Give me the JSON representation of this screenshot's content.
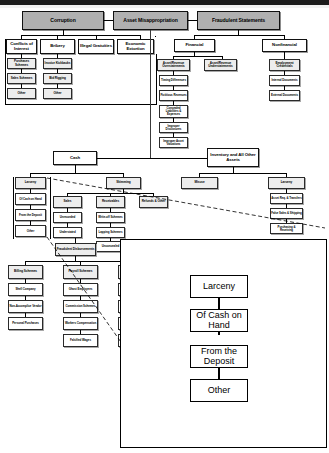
{
  "diagram": {
    "type": "hierarchy-tree-with-magnified-callout",
    "colors": {
      "level1_fill": "#b0b0b0",
      "level2_fill": "#ffffff",
      "level3_fill": "#ededed",
      "node_border": "#000000",
      "top_band": "#1c1c1c",
      "callout_border": "#000000",
      "leader_line": "#000000"
    }
  },
  "branches": {
    "corruption": {
      "label": "Corruption",
      "children": [
        {
          "label": "Conflicts of Interest",
          "children": [
            "Purchases Schemes",
            "Sales Schemes",
            "Other"
          ]
        },
        {
          "label": "Bribery",
          "children": [
            "Invoice Kickbacks",
            "Bid Rigging",
            "Other"
          ]
        },
        {
          "label": "Illegal Gratuities",
          "children": []
        },
        {
          "label": "Economic Extortion",
          "children": []
        }
      ]
    },
    "asset_misappropriation": {
      "label": "Asset Misappropriation",
      "children": [
        {
          "label": "Cash",
          "children": [
            {
              "label": "Larceny",
              "children": [
                "Of Cash on Hand",
                "From the Deposit",
                "Other"
              ]
            },
            {
              "label": "Skimming",
              "children": [
                {
                  "label": "Sales",
                  "children": [
                    "Unrecorded",
                    "Understated"
                  ]
                },
                {
                  "label": "Receivables",
                  "children": [
                    "Write-off Schemes",
                    "Lapping Schemes",
                    "Unconcealed"
                  ]
                },
                {
                  "label": "Refunds & Other",
                  "children": []
                }
              ]
            },
            {
              "label": "Fraudulent Disbursements",
              "children": [
                {
                  "label": "Billing Schemes",
                  "children": [
                    "Shell Company",
                    "Non-Accomplice Vendor",
                    "Personal Purchases"
                  ]
                },
                {
                  "label": "Payroll Schemes",
                  "children": [
                    "Ghost Employees",
                    "Commission Schemes",
                    "Workers Compensation",
                    "Falsified Wages"
                  ]
                },
                {
                  "label": "Expense Reimbursement Schemes",
                  "children": [
                    "Mischaracterized Expenses",
                    "Overstated Expenses",
                    "Fictitious Expenses",
                    "Multiple Reimbursements"
                  ]
                }
              ]
            }
          ]
        },
        {
          "label": "Inventory and All Other Assets",
          "children": [
            {
              "label": "Misuse",
              "children": []
            },
            {
              "label": "Larceny",
              "children": [
                "Asset Req. & Transfers",
                "False Sales & Shipping",
                "Purchasing & Receiving"
              ]
            }
          ]
        }
      ]
    },
    "fraudulent_statements": {
      "label": "Fraudulent Statements",
      "children": [
        {
          "label": "Financial",
          "children": [
            {
              "label": "Asset/Revenue Overstatements",
              "children": [
                "Timing Differences",
                "Fictitious Revenues",
                "Concealed Liabilities & Expenses",
                "Improper Disclosures",
                "Improper Asset Valuations"
              ]
            },
            {
              "label": "Asset/Revenue Understatements",
              "children": []
            }
          ]
        },
        {
          "label": "Nonfinancial",
          "children": [
            "Employment Credentials",
            "Internal Documents",
            "External Documents"
          ]
        }
      ]
    }
  },
  "callout": {
    "source_node": "Larceny",
    "nodes": [
      "Larceny",
      "Of Cash on Hand",
      "From the Deposit",
      "Other"
    ]
  },
  "nodes_flat": {
    "corruption": "Corruption",
    "asset_misappropriation": "Asset Misappropriation",
    "fraudulent_statements": "Fraudulent Statements",
    "conflicts_of_interest": "Conflicts of Interest",
    "bribery": "Bribery",
    "illegal_gratuities": "Illegal Gratuities",
    "economic_extortion": "Economic Extortion",
    "purchases_schemes": "Purchases Schemes",
    "sales_schemes": "Sales Schemes",
    "corruption_coi_other": "Other",
    "invoice_kickbacks": "Invoice Kickbacks",
    "bid_rigging": "Bid Rigging",
    "bribery_other": "Other",
    "financial": "Financial",
    "nonfinancial": "Nonfinancial",
    "asset_revenue_overstatements": "Asset/Revenue Overstatements",
    "asset_revenue_understatements": "Asset/Revenue Understatements",
    "timing_differences": "Timing Differences",
    "fictitious_revenues": "Fictitious Revenues",
    "concealed_liabilities": "Concealed Liabilities & Expenses",
    "improper_disclosures": "Improper Disclosures",
    "improper_asset_valuations": "Improper Asset Valuations",
    "employment_credentials": "Employment Credentials",
    "internal_documents": "Internal Documents",
    "external_documents": "External Documents",
    "cash": "Cash",
    "inventory_all_other": "Inventory and All Other Assets",
    "cash_larceny": "Larceny",
    "of_cash_on_hand": "Of Cash on Hand",
    "from_the_deposit": "From the Deposit",
    "larceny_other": "Other",
    "skimming": "Skimming",
    "sales": "Sales",
    "receivables": "Receivables",
    "refunds_other": "Refunds & Other",
    "unrecorded": "Unrecorded",
    "understated": "Understated",
    "write_off_schemes": "Write-off Schemes",
    "lapping_schemes": "Lapping Schemes",
    "unconcealed": "Unconcealed",
    "fraudulent_disbursements": "Fraudulent Disbursements",
    "billing_schemes": "Billing Schemes",
    "payroll_schemes": "Payroll Schemes",
    "expense_reimbursement_schemes": "Expense Reimbursement Schemes",
    "shell_company": "Shell Company",
    "non_accomplice_vendor": "Non-Accomplice Vendor",
    "personal_purchases": "Personal Purchases",
    "ghost_employees": "Ghost Employees",
    "commission_schemes": "Commission Schemes",
    "workers_compensation": "Workers Compensation",
    "falsified_wages": "Falsified Wages",
    "mischaracterized_expenses": "Mischaracterized Expenses",
    "overstated_expenses": "Overstated Expenses",
    "fictitious_expenses": "Fictitious Expenses",
    "multiple_reimbursements": "Multiple Reimbursements",
    "misuse": "Misuse",
    "inv_larceny": "Larceny",
    "asset_req_transfers": "Asset Req. & Transfers",
    "false_sales_shipping": "False Sales & Shipping",
    "purchasing_receiving": "Purchasing & Receiving",
    "z_larceny": "Larceny",
    "z_of_cash_on_hand": "Of Cash on Hand",
    "z_from_the_deposit": "From the Deposit",
    "z_other": "Other"
  }
}
